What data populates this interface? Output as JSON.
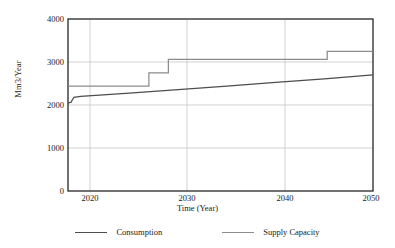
{
  "chart_data": {
    "type": "line",
    "title": "",
    "xlabel": "Time (Year)",
    "ylabel": "Mm3/Year",
    "xlim": [
      2018.7,
      2050
    ],
    "ylim": [
      0,
      4000
    ],
    "xticks": [
      2020,
      2030,
      2040,
      2050
    ],
    "yticks": [
      0,
      1000,
      2000,
      3000,
      4000
    ],
    "grid": "both",
    "legend_position": "bottom",
    "series": [
      {
        "name": "Consumption",
        "color": "#4d4d4d",
        "style": "line",
        "x": [
          2018.7,
          2019.0,
          2019.3,
          2020,
          2025,
          2030,
          2035,
          2040,
          2045,
          2050
        ],
        "values": [
          2050,
          2060,
          2180,
          2200,
          2275,
          2355,
          2440,
          2525,
          2610,
          2700
        ]
      },
      {
        "name": "Supply Capacity",
        "color": "#8c8c8c",
        "style": "step",
        "x": [
          2018.7,
          2027.0,
          2027.0,
          2029.0,
          2029.0,
          2045.3,
          2045.3,
          2050
        ],
        "values": [
          2440,
          2440,
          2750,
          2750,
          3060,
          3060,
          3250,
          3250
        ]
      }
    ]
  },
  "axes": {
    "y_tick_labels": [
      "4000",
      "3000",
      "2000",
      "1000",
      "0"
    ],
    "x_tick_labels": [
      "2020",
      "2030",
      "2040",
      "2050"
    ],
    "y_axis_title": "Mm3/Year",
    "x_axis_title": "Time (Year)"
  },
  "legend": {
    "items": [
      {
        "label": "Consumption",
        "color": "#4d4d4d"
      },
      {
        "label": "Supply Capacity",
        "color": "#8c8c8c"
      }
    ]
  },
  "colors": {
    "consumption": "#4d4d4d",
    "supply_capacity": "#8c8c8c",
    "axis": "#262626",
    "grid": "#bfbfbf",
    "background": "#ffffff"
  }
}
